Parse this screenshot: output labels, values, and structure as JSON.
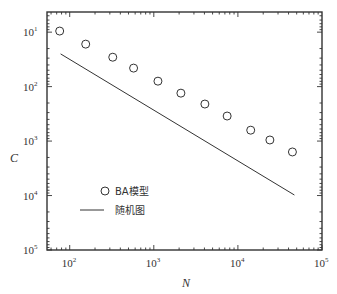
{
  "chart_data": {
    "type": "scatter",
    "title": "",
    "xlabel": "N",
    "ylabel": "C",
    "xscale": "log",
    "yscale": "log",
    "xlim_log10": [
      1.73,
      5.0
    ],
    "ylim_exponent_top_to_bottom": [
      0.63,
      5.0
    ],
    "x_ticks": [
      {
        "base": "10",
        "exp": "2",
        "value": 100
      },
      {
        "base": "10",
        "exp": "3",
        "value": 1000
      },
      {
        "base": "10",
        "exp": "4",
        "value": 10000
      },
      {
        "base": "10",
        "exp": "5",
        "value": 100000
      }
    ],
    "y_ticks": [
      {
        "base": "10",
        "exp": "1",
        "pos": 1
      },
      {
        "base": "10",
        "exp": "2",
        "pos": 2
      },
      {
        "base": "10",
        "exp": "3",
        "pos": 3
      },
      {
        "base": "10",
        "exp": "4",
        "pos": 4
      },
      {
        "base": "10",
        "exp": "5",
        "pos": 5
      }
    ],
    "grid": false,
    "legend_position": "lower left (inside)",
    "series": [
      {
        "name": "BA模型",
        "marker": "open-circle",
        "x": [
          76,
          155,
          325,
          575,
          1120,
          2100,
          4050,
          7450,
          14200,
          24000,
          44500
        ],
        "y_exponent": [
          0.98,
          1.22,
          1.46,
          1.66,
          1.9,
          2.12,
          2.32,
          2.54,
          2.8,
          2.98,
          3.2
        ]
      },
      {
        "name": "随机图",
        "marker": "line",
        "x": [
          78,
          47000
        ],
        "y_exponent": [
          1.4,
          3.99
        ]
      }
    ]
  },
  "legend": [
    {
      "label": "BA模型",
      "symbol": "circle"
    },
    {
      "label": "随机图",
      "symbol": "line"
    }
  ],
  "axes": {
    "xlabel": "N",
    "ylabel": "C"
  },
  "colors": {
    "ink": "#333333",
    "background": "#ffffff"
  }
}
